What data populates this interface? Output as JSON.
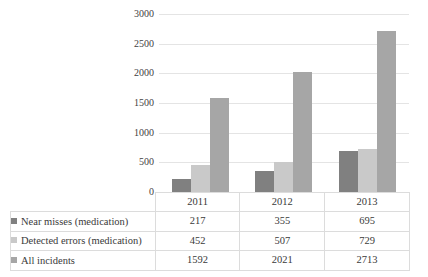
{
  "chart_data": {
    "type": "bar",
    "title": "",
    "xlabel": "",
    "ylabel": "Number",
    "ylim": [
      0,
      3000
    ],
    "ytick_labels": [
      "3000",
      "2500",
      "2000",
      "1500",
      "1000",
      "500",
      "0"
    ],
    "ytick_values": [
      3000,
      2500,
      2000,
      1500,
      1000,
      500,
      0
    ],
    "grid": true,
    "legend_position": "table-below",
    "categories": [
      "2011",
      "2012",
      "2013"
    ],
    "series": [
      {
        "name": "Near misses (medication)",
        "color": "#808080",
        "values": [
          217,
          355,
          695
        ]
      },
      {
        "name": "Detected errors (medication)",
        "color": "#c9c9c9",
        "values": [
          452,
          507,
          729
        ]
      },
      {
        "name": "All incidents",
        "color": "#a6a6a6",
        "values": [
          1592,
          2021,
          2713
        ]
      }
    ]
  }
}
